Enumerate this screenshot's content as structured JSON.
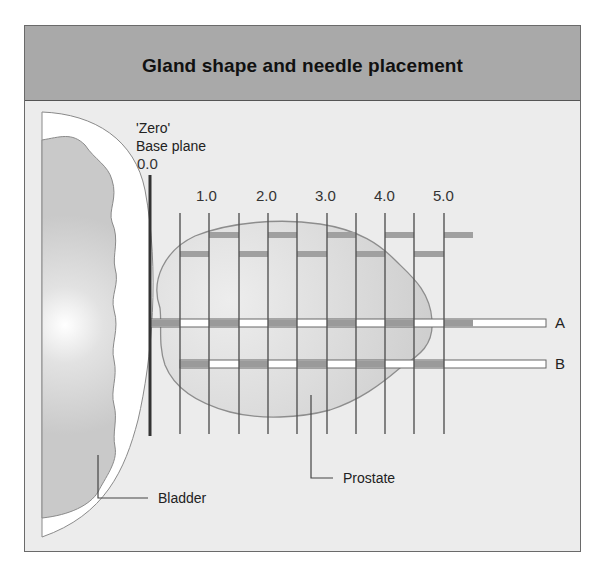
{
  "title": "Gland shape and needle placement",
  "base_plane": {
    "line1": "'Zero'",
    "line2": "Base plane",
    "value": "0.0"
  },
  "ticks": [
    {
      "label": "1.0",
      "x": 196
    },
    {
      "label": "2.0",
      "x": 255
    },
    {
      "label": "3.0",
      "x": 314
    },
    {
      "label": "4.0",
      "x": 373
    },
    {
      "label": "5.0",
      "x": 432
    }
  ],
  "needle_rows": [
    {
      "label": "A"
    },
    {
      "label": "B"
    }
  ],
  "annotations": {
    "prostate": "Prostate",
    "bladder": "Bladder"
  },
  "colors": {
    "header": "#a9a9a9",
    "background": "#ececec",
    "prostate_fill": "#d4d4d4",
    "bar": "#9a9a9a",
    "line": "#555555"
  }
}
